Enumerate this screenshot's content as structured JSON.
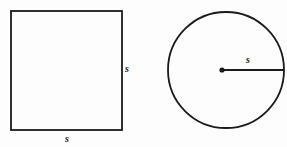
{
  "figure": {
    "background_color": "#fdfdfd",
    "stroke_color": "#1a1a1a",
    "label_color": "#1a1a1a",
    "square": {
      "name": "square",
      "x": 11,
      "y": 11,
      "width": 111,
      "height": 119,
      "stroke_width": 1.8,
      "fill": "none",
      "labels": {
        "right_side": "s",
        "bottom_side": "s"
      },
      "label_positions": {
        "right_side": {
          "x": 127,
          "y": 72
        },
        "bottom_side": {
          "x": 67,
          "y": 142
        }
      }
    },
    "circle": {
      "name": "circle",
      "center_x": 226,
      "center_y": 70,
      "radius": 58,
      "stroke_width": 1.8,
      "fill": "none",
      "center_dot_radius": 2.6,
      "radius_line": {
        "name": "radius-line",
        "x1": 222,
        "y1": 70,
        "x2": 284,
        "y2": 70,
        "stroke_width": 2.2
      },
      "labels": {
        "radius": "s"
      },
      "label_positions": {
        "radius": {
          "x": 248,
          "y": 63
        }
      }
    }
  }
}
